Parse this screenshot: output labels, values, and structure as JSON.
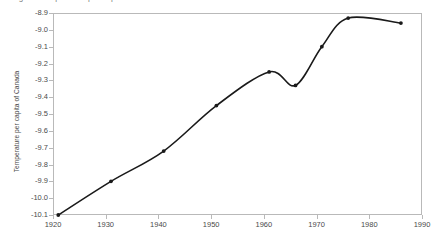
{
  "chart_data": {
    "type": "line",
    "title": "Figure: Temperature per capita of Canada",
    "xlabel": "",
    "ylabel": "Temperature per capita of Canada",
    "xlim": [
      1920,
      1990
    ],
    "ylim": [
      -10.1,
      -8.9
    ],
    "xticks": [
      1920,
      1930,
      1940,
      1950,
      1960,
      1970,
      1980,
      1990
    ],
    "xticklabels": [
      "1920",
      "1930",
      "1940",
      "1950",
      "1960",
      "1970",
      "1980",
      "1990"
    ],
    "yticks": [
      -8.9,
      -9.0,
      -9.1,
      -9.2,
      -9.3,
      -9.4,
      -9.5,
      -9.6,
      -9.7,
      -9.8,
      -9.9,
      -10.0,
      -10.1
    ],
    "yticklabels": [
      "-8.9",
      "-9.0",
      "-9.1",
      "-9.2",
      "-9.3",
      "-9.4",
      "-9.5",
      "-9.6",
      "-9.7",
      "-9.8",
      "-9.9",
      "-10.0",
      "-10.1"
    ],
    "grid": false,
    "legend": false,
    "smoothing": "spline",
    "marker": "filled-circle",
    "line_color": "#1a1a1a",
    "frame_color": "#b9b9b9",
    "series": [
      {
        "name": "Temperature per capita of Canada",
        "x": [
          1921,
          1931,
          1941,
          1951,
          1961,
          1966,
          1971,
          1976,
          1986
        ],
        "y": [
          -10.1,
          -9.9,
          -9.72,
          -9.45,
          -9.25,
          -9.33,
          -9.1,
          -8.93,
          -8.96
        ]
      }
    ]
  },
  "axes": {
    "y_title": "Temperature per capita of Canada"
  }
}
